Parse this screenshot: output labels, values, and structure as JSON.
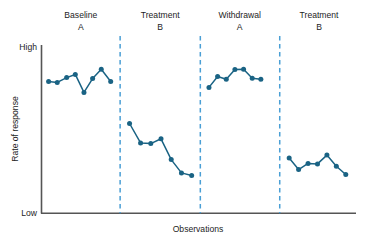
{
  "chart_data": {
    "type": "line",
    "title": "",
    "xlabel": "Observations",
    "ylabel": "Rate of response",
    "ylim": [
      0,
      1
    ],
    "xlim": [
      0,
      30
    ],
    "grid": false,
    "legend": "none",
    "y_tick_labels": [
      "High",
      "Low"
    ],
    "y_tick_values": [
      1,
      0
    ],
    "x_tick_labels": [],
    "accent_color": "#1a6384",
    "divider_color": "#4a9fd5",
    "axis_color": "#555555",
    "phase_dividers_x": [
      10.0,
      20.2,
      30.3
    ],
    "phases": [
      {
        "name": "Baseline",
        "condition": "A",
        "label_x": 5.0,
        "points": [
          {
            "x": 0.9,
            "y": 0.793
          },
          {
            "x": 2.0,
            "y": 0.787
          },
          {
            "x": 3.2,
            "y": 0.816
          },
          {
            "x": 4.3,
            "y": 0.835
          },
          {
            "x": 5.4,
            "y": 0.727
          },
          {
            "x": 6.5,
            "y": 0.81
          },
          {
            "x": 7.6,
            "y": 0.866
          },
          {
            "x": 8.8,
            "y": 0.793
          }
        ]
      },
      {
        "name": "Treatment",
        "condition": "B",
        "label_x": 15.1,
        "points": [
          {
            "x": 11.2,
            "y": 0.54
          },
          {
            "x": 12.6,
            "y": 0.423
          },
          {
            "x": 13.9,
            "y": 0.419
          },
          {
            "x": 15.2,
            "y": 0.448
          },
          {
            "x": 16.5,
            "y": 0.323
          },
          {
            "x": 17.8,
            "y": 0.243
          },
          {
            "x": 19.1,
            "y": 0.227
          }
        ]
      },
      {
        "name": "Withdrawal",
        "condition": "A",
        "label_x": 25.2,
        "points": [
          {
            "x": 21.3,
            "y": 0.757
          },
          {
            "x": 22.4,
            "y": 0.823
          },
          {
            "x": 23.5,
            "y": 0.806
          },
          {
            "x": 24.6,
            "y": 0.864
          },
          {
            "x": 25.7,
            "y": 0.866
          },
          {
            "x": 26.8,
            "y": 0.812
          },
          {
            "x": 27.9,
            "y": 0.806
          }
        ]
      },
      {
        "name": "Treatment",
        "condition": "B",
        "label_x": 35.3,
        "points": [
          {
            "x": 31.5,
            "y": 0.332
          },
          {
            "x": 32.7,
            "y": 0.263
          },
          {
            "x": 33.9,
            "y": 0.3
          },
          {
            "x": 35.1,
            "y": 0.297
          },
          {
            "x": 36.3,
            "y": 0.35
          },
          {
            "x": 37.5,
            "y": 0.283
          },
          {
            "x": 38.7,
            "y": 0.233
          }
        ]
      }
    ]
  }
}
